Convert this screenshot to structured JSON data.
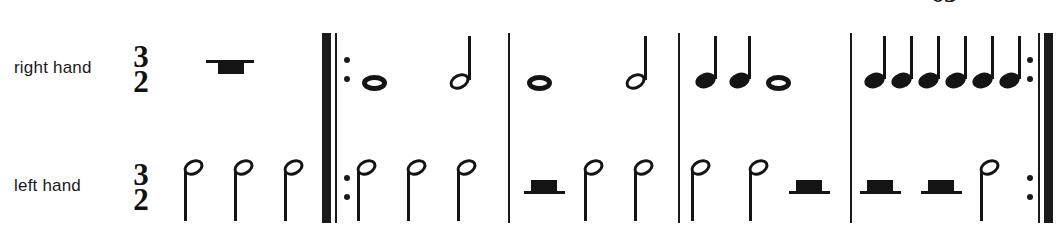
{
  "score": {
    "page_number": "65",
    "time_signature": {
      "numerator": "3",
      "denominator": "2"
    },
    "staves": [
      {
        "id": "right-hand",
        "label": "right hand"
      },
      {
        "id": "left-hand",
        "label": "left hand"
      }
    ],
    "colors": {
      "ink": "#141414",
      "paper": "#ffffff"
    },
    "barlines": [
      {
        "name": "start-repeat",
        "type": "repeat-start",
        "x": 323
      },
      {
        "name": "barline-1",
        "type": "single",
        "x": 508
      },
      {
        "name": "barline-2",
        "type": "single",
        "x": 678
      },
      {
        "name": "barline-3",
        "type": "single",
        "x": 850
      },
      {
        "name": "end-repeat",
        "type": "repeat-end",
        "x": 1032
      }
    ],
    "measures": [
      {
        "name": "pickup",
        "right_hand": [
          {
            "type": "rest",
            "value": "half-hanging",
            "x": 206
          }
        ],
        "left_hand": [
          {
            "type": "note",
            "value": "half",
            "x": 183,
            "stem": "down"
          },
          {
            "type": "note",
            "value": "half",
            "x": 233,
            "stem": "down"
          },
          {
            "type": "note",
            "value": "half",
            "x": 283,
            "stem": "down"
          }
        ]
      },
      {
        "name": "measure-1",
        "right_hand": [
          {
            "type": "note",
            "value": "whole",
            "x": 362
          },
          {
            "type": "note",
            "value": "half",
            "x": 449,
            "stem": "up"
          }
        ],
        "left_hand": [
          {
            "type": "note",
            "value": "half",
            "x": 356,
            "stem": "down"
          },
          {
            "type": "note",
            "value": "half",
            "x": 406,
            "stem": "down"
          },
          {
            "type": "note",
            "value": "half",
            "x": 456,
            "stem": "down"
          }
        ]
      },
      {
        "name": "measure-2",
        "right_hand": [
          {
            "type": "note",
            "value": "whole",
            "x": 527
          },
          {
            "type": "note",
            "value": "half",
            "x": 625,
            "stem": "up"
          }
        ],
        "left_hand": [
          {
            "type": "rest",
            "value": "half",
            "x": 527
          },
          {
            "type": "note",
            "value": "half",
            "x": 583,
            "stem": "down"
          },
          {
            "type": "note",
            "value": "half",
            "x": 633,
            "stem": "down"
          }
        ]
      },
      {
        "name": "measure-3",
        "right_hand": [
          {
            "type": "note",
            "value": "quarter",
            "x": 697,
            "stem": "up"
          },
          {
            "type": "note",
            "value": "quarter",
            "x": 731,
            "stem": "up"
          },
          {
            "type": "note",
            "value": "whole",
            "x": 766
          }
        ],
        "left_hand": [
          {
            "type": "note",
            "value": "half",
            "x": 690,
            "stem": "down"
          },
          {
            "type": "note",
            "value": "half",
            "x": 748,
            "stem": "down"
          },
          {
            "type": "rest",
            "value": "half",
            "x": 790
          }
        ]
      },
      {
        "name": "measure-4",
        "right_hand": [
          {
            "type": "note",
            "value": "quarter",
            "x": 866,
            "stem": "up"
          },
          {
            "type": "note",
            "value": "quarter",
            "x": 896,
            "stem": "up"
          },
          {
            "type": "note",
            "value": "quarter",
            "x": 926,
            "stem": "up"
          },
          {
            "type": "note",
            "value": "quarter",
            "x": 956,
            "stem": "up"
          },
          {
            "type": "note",
            "value": "quarter",
            "x": 986,
            "stem": "up"
          },
          {
            "type": "note",
            "value": "quarter",
            "x": 1002,
            "stem": "up"
          }
        ],
        "left_hand": [
          {
            "type": "rest",
            "value": "half",
            "x": 862
          },
          {
            "type": "rest",
            "value": "half",
            "x": 924
          },
          {
            "type": "note",
            "value": "half",
            "x": 982,
            "stem": "down"
          }
        ]
      }
    ]
  }
}
